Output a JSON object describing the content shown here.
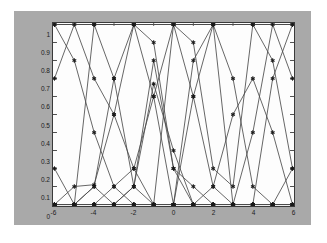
{
  "figure": {
    "background_color": "#a9a9a9",
    "plot_background_color": "#fdfdfd",
    "axis_color": "#3a3a3a",
    "line_color": "#4a4a4a",
    "marker_color": "#1a1a1a"
  },
  "chart_data": {
    "type": "line",
    "title": "",
    "xlabel": "",
    "ylabel": "",
    "xlim": [
      -6,
      6
    ],
    "ylim": [
      0,
      1
    ],
    "grid": false,
    "legend_position": "none",
    "marker": "star",
    "xticks": [
      -6,
      -4,
      -2,
      0,
      2,
      4,
      6
    ],
    "xtick_labels": [
      "-6",
      "-4",
      "-2",
      "0",
      "2",
      "4",
      "6"
    ],
    "yticks": [
      0,
      0.1,
      0.2,
      0.3,
      0.4,
      0.5,
      0.6,
      0.7,
      0.8,
      0.9,
      1
    ],
    "ytick_labels": [
      "0",
      "0.1",
      "0.2",
      "0.3",
      "0.4",
      "0.5",
      "0.6",
      "0.7",
      "0.8",
      "0.9",
      "1"
    ],
    "series": [
      {
        "name": "mf1",
        "x": [
          -6,
          -5,
          -4,
          -3,
          -2,
          -1,
          0,
          1,
          2,
          3,
          4,
          5,
          6
        ],
        "values": [
          1,
          0.8,
          0.4,
          0.1,
          0,
          0,
          0,
          0,
          0,
          0,
          0,
          0,
          0
        ]
      },
      {
        "name": "mf2",
        "x": [
          -6,
          -5,
          -4,
          -3,
          -2,
          -1,
          0,
          1,
          2,
          3,
          4,
          5,
          6
        ],
        "values": [
          0.7,
          1,
          0.7,
          0.5,
          0.2,
          0,
          0,
          0,
          0,
          0,
          0,
          0,
          0
        ]
      },
      {
        "name": "mf3",
        "x": [
          -6,
          -5,
          -4,
          -3,
          -2,
          -1,
          0,
          1,
          2,
          3,
          4,
          5,
          6
        ],
        "values": [
          0.2,
          0,
          0.1,
          0.7,
          1,
          0.9,
          0.2,
          0,
          0,
          0,
          0,
          0,
          0
        ]
      },
      {
        "name": "mf4",
        "x": [
          -6,
          -5,
          -4,
          -3,
          -2,
          -1,
          0,
          1,
          2,
          3,
          4,
          5,
          6
        ],
        "values": [
          0,
          0,
          0,
          0.1,
          0.2,
          0.6,
          1,
          0.6,
          0.1,
          0,
          0,
          0,
          0
        ]
      },
      {
        "name": "mf5",
        "x": [
          -6,
          -5,
          -4,
          -3,
          -2,
          -1,
          0,
          1,
          2,
          3,
          4,
          5,
          6
        ],
        "values": [
          0,
          0,
          0,
          0,
          0.1,
          0.67,
          0.3,
          0,
          0.1,
          0.5,
          0.7,
          0.4,
          0
        ]
      },
      {
        "name": "mf6",
        "x": [
          -6,
          -5,
          -4,
          -3,
          -2,
          -1,
          0,
          1,
          2,
          3,
          4,
          5,
          6
        ],
        "values": [
          0,
          0,
          0,
          0,
          0,
          0,
          0,
          0.8,
          1,
          0.7,
          0.1,
          0,
          0.2
        ]
      },
      {
        "name": "mf7",
        "x": [
          -6,
          -5,
          -4,
          -3,
          -2,
          -1,
          0,
          1,
          2,
          3,
          4,
          5,
          6
        ],
        "values": [
          0,
          0,
          0,
          0,
          0,
          0,
          1,
          0.9,
          0.2,
          0.1,
          1,
          0.8,
          0.2
        ]
      },
      {
        "name": "mf8",
        "x": [
          -6,
          -5,
          -4,
          -3,
          -2,
          -1,
          0,
          1,
          2,
          3,
          4,
          5,
          6
        ],
        "values": [
          0,
          0,
          1,
          0.7,
          0.1,
          0,
          0,
          0,
          0,
          0,
          0,
          0.7,
          1
        ]
      },
      {
        "name": "mf9",
        "x": [
          -6,
          -5,
          -4,
          -3,
          -2,
          -1,
          0,
          1,
          2,
          3,
          4,
          5,
          6
        ],
        "values": [
          0,
          0.1,
          0.11,
          0.5,
          1,
          0.6,
          0,
          0.6,
          1,
          0,
          0,
          0,
          0
        ]
      },
      {
        "name": "mf10",
        "x": [
          -6,
          -5,
          -4,
          -3,
          -2,
          -1,
          0,
          1,
          2,
          3,
          4,
          5,
          6
        ],
        "values": [
          1,
          1,
          1,
          1,
          1,
          1,
          1,
          1,
          1,
          1,
          1,
          1,
          1
        ]
      },
      {
        "name": "mf11",
        "x": [
          -6,
          -5,
          -4,
          -3,
          -2,
          -1,
          0,
          1,
          2,
          3,
          4,
          5,
          6
        ],
        "values": [
          0,
          0,
          0.1,
          0,
          0.1,
          0.8,
          0.2,
          0.1,
          0,
          0,
          0.4,
          1,
          0.7
        ]
      }
    ]
  }
}
